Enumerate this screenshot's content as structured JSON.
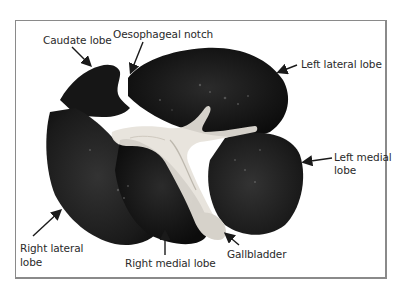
{
  "figure": {
    "labels": {
      "caudate_lobe": "Caudate lobe",
      "oesophageal_notch": "Oesophageal notch",
      "left_lateral_lobe": "Left lateral lobe",
      "left_medial_lobe_line1": "Left medial",
      "left_medial_lobe_line2": "lobe",
      "right_lateral_lobe_line1": "Right lateral",
      "right_lateral_lobe_line2": "lobe",
      "right_medial_lobe": "Right medial lobe",
      "gallbladder": "Gallbladder"
    },
    "colors": {
      "frame": "#8a8a8a",
      "tissue_dark": "#141414",
      "tissue_mid": "#2a2a2a",
      "connective_light": "#e8e4dc",
      "label_text": "#2a2a2a",
      "arrow": "#1a1a1a"
    }
  }
}
